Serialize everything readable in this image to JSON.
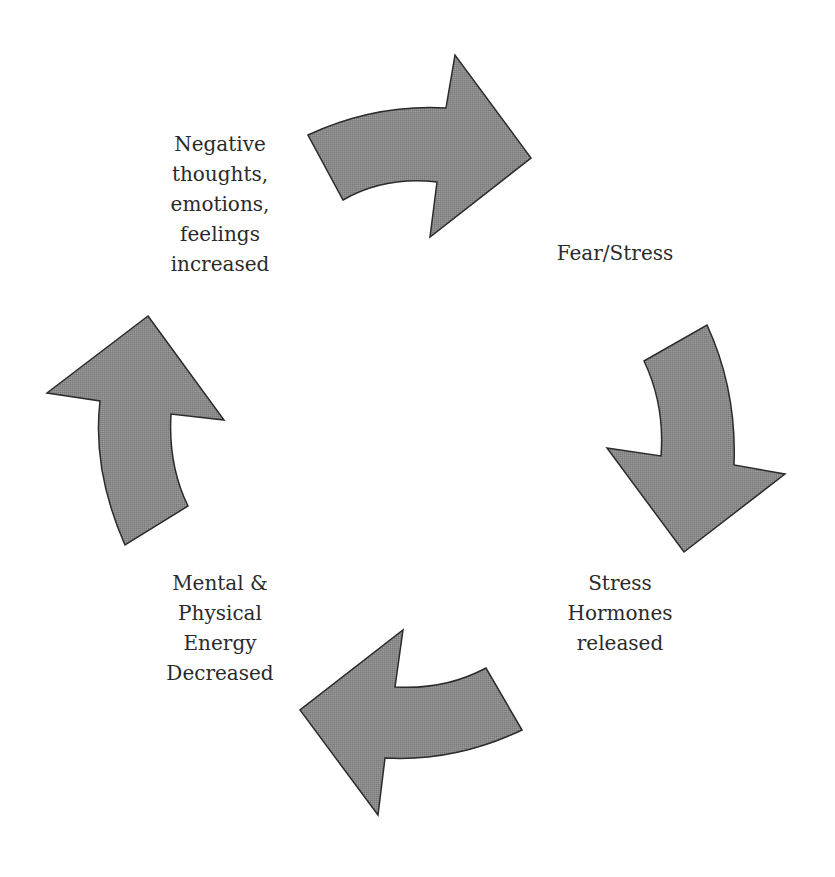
{
  "diagram": {
    "type": "cycle",
    "direction": "clockwise",
    "arrow_fill": "#8a8a8a",
    "arrow_stroke": "#2b2b2b",
    "text_color": "#2a2a2a",
    "nodes": [
      {
        "id": "negative",
        "lines": [
          "Negative",
          "thoughts,",
          "emotions,",
          "feelings",
          "increased"
        ]
      },
      {
        "id": "fear",
        "lines": [
          "Fear/Stress"
        ]
      },
      {
        "id": "hormones",
        "lines": [
          "Stress",
          "Hormones",
          "released"
        ]
      },
      {
        "id": "energy",
        "lines": [
          "Mental &",
          "Physical",
          "Energy",
          "Decreased"
        ]
      }
    ],
    "arrows": [
      {
        "id": "top",
        "from": "negative",
        "to": "fear"
      },
      {
        "id": "right",
        "from": "fear",
        "to": "hormones"
      },
      {
        "id": "bottom",
        "from": "hormones",
        "to": "energy"
      },
      {
        "id": "left",
        "from": "energy",
        "to": "negative"
      }
    ]
  }
}
